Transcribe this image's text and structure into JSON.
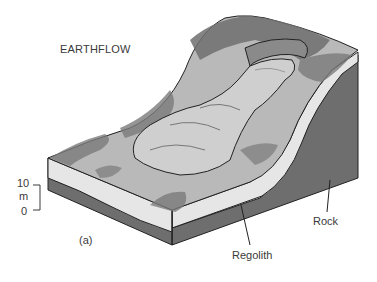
{
  "figure": {
    "title": "EARTHFLOW",
    "panel_label": "(a)",
    "scale_bar": {
      "top_value": "10",
      "unit": "m",
      "bottom_value": "0"
    },
    "labels": {
      "regolith": "Regolith",
      "rock": "Rock"
    },
    "colors": {
      "regolith": "#e6e6e6",
      "rock": "#6e6e6e",
      "surface": "#b9b9b9",
      "vegetation": "#7a7a7a",
      "flow_lobe": "#cfcfcf",
      "outline": "#222222",
      "text": "#3a3a3a"
    }
  }
}
